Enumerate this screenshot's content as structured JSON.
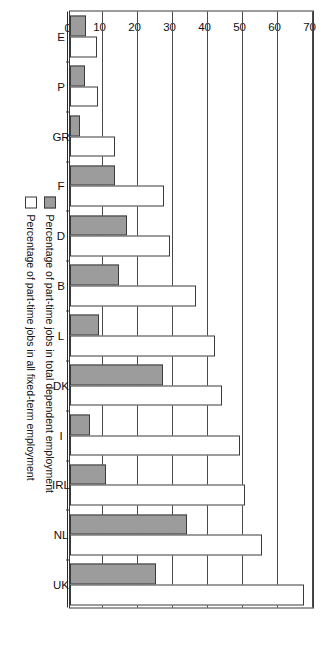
{
  "chart_data": {
    "type": "bar",
    "orientation": "horizontal",
    "title": "",
    "xlabel": "",
    "ylabel": "",
    "ylim": [
      0,
      70
    ],
    "yticks": [
      "0",
      "10",
      "20",
      "30",
      "40",
      "50",
      "60",
      "70"
    ],
    "grid": true,
    "legend_position": "bottom-right",
    "categories": [
      "E",
      "P",
      "GR",
      "F",
      "D",
      "B",
      "L",
      "DK",
      "I",
      "IRL",
      "NL",
      "UK"
    ],
    "series": [
      {
        "name": "Percentage of part-time jobs in total dependent employment",
        "color": "#9c9c9c",
        "values": [
          4.6,
          4.3,
          3.0,
          13.0,
          16.4,
          14.0,
          8.2,
          26.5,
          5.8,
          10.3,
          33.5,
          24.5
        ]
      },
      {
        "name": "Percentage of part-time jobs in all fixed-term employment",
        "color": "#ffffff",
        "values": [
          7.7,
          7.9,
          13.0,
          27.0,
          28.5,
          36.0,
          41.5,
          43.5,
          48.5,
          50.0,
          55.0,
          67.0
        ]
      }
    ]
  },
  "legend": {
    "items": [
      {
        "label": "Percentage of part-time jobs in total dependent employment",
        "swatch": "gray"
      },
      {
        "label": "Percentage of part-time jobs in all fixed-term employment",
        "swatch": "white"
      }
    ]
  },
  "colors": {
    "series_gray": "#9c9c9c",
    "series_white": "#ffffff",
    "axis": "#3a3a3a",
    "text": "#111111"
  }
}
